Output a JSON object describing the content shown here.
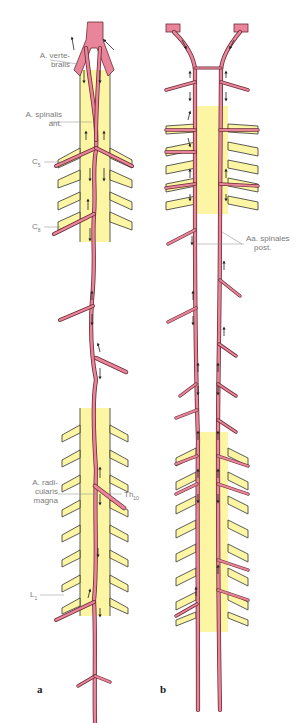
{
  "figure": {
    "colors": {
      "artery_fill": "#e9859a",
      "artery_outline": "#6b2a35",
      "cord_fill": "#fcf6a4",
      "cord_outline": "#333333",
      "label_text": "#7a7a7a",
      "background": "#ffffff"
    },
    "panels": [
      {
        "id": "a",
        "label": "a",
        "labels": {
          "vertebralis_1": "A. verte-",
          "vertebralis_2": "bralis",
          "spinalis_ant_1": "A. spinalis",
          "spinalis_ant_2": "ant.",
          "c5": "C",
          "c5_sub": "5",
          "c8": "C",
          "c8_sub": "8",
          "radicularis_1": "A. radi-",
          "radicularis_2": "cularis",
          "radicularis_3": "magna",
          "th10": "Th",
          "th10_sub": "10",
          "l1": "L",
          "l1_sub": "1"
        }
      },
      {
        "id": "b",
        "label": "b",
        "labels": {
          "spinales_post_1": "Aa. spinales",
          "spinales_post_2": "post."
        }
      }
    ]
  }
}
